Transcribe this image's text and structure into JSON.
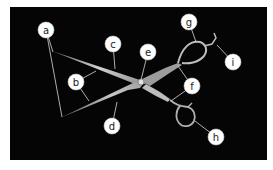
{
  "diagram": {
    "background_color": "#050505",
    "label_fill": "#ffffff",
    "leader_color": "#d8d8d8",
    "labels": [
      {
        "id": "a",
        "text": "a",
        "cx": 46,
        "cy": 30,
        "targets": [
          [
            53,
            52
          ],
          [
            62,
            117
          ]
        ]
      },
      {
        "id": "b",
        "text": "b",
        "cx": 76,
        "cy": 82,
        "targets": [
          [
            96,
            71
          ],
          [
            89,
            101
          ]
        ]
      },
      {
        "id": "c",
        "text": "c",
        "cx": 113,
        "cy": 44,
        "targets": [
          [
            115,
            69
          ]
        ]
      },
      {
        "id": "d",
        "text": "d",
        "cx": 112,
        "cy": 126,
        "targets": [
          [
            117,
            102
          ]
        ]
      },
      {
        "id": "e",
        "text": "e",
        "cx": 148,
        "cy": 52,
        "targets": [
          [
            141,
            80
          ]
        ]
      },
      {
        "id": "f",
        "text": "f",
        "cx": 192,
        "cy": 86,
        "targets": [
          [
            178,
            66
          ],
          [
            171,
            101
          ]
        ]
      },
      {
        "id": "g",
        "text": "g",
        "cx": 189,
        "cy": 22,
        "targets": [
          [
            196,
            42
          ]
        ]
      },
      {
        "id": "h",
        "text": "h",
        "cx": 216,
        "cy": 137,
        "targets": [
          [
            195,
            121
          ]
        ]
      },
      {
        "id": "i",
        "text": "i",
        "cx": 233,
        "cy": 62,
        "targets": [
          [
            217,
            45
          ]
        ]
      }
    ]
  }
}
